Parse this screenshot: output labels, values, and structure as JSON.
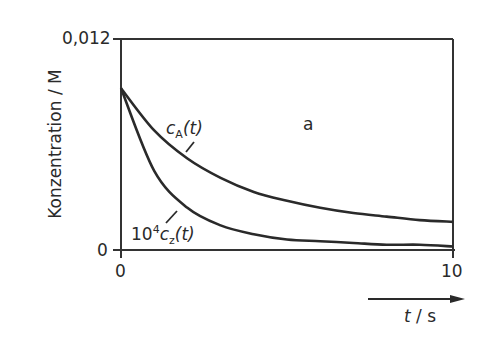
{
  "chart_data": {
    "type": "line",
    "title": "",
    "panel_label": "a",
    "xlabel": "t / s",
    "ylabel": "Konzentration / M",
    "xlim": [
      0,
      10
    ],
    "ylim": [
      0,
      0.012
    ],
    "x_ticks": [
      "0",
      "10"
    ],
    "y_ticks": [
      "0",
      "0,012"
    ],
    "grid": false,
    "legend": "inline annotations",
    "x": [
      0,
      1,
      2,
      3,
      4,
      5,
      6,
      7,
      8,
      9,
      10
    ],
    "series": [
      {
        "name": "c_A(t)",
        "label": "cA(t)",
        "values": [
          0.0092,
          0.0068,
          0.0052,
          0.0041,
          0.0033,
          0.0028,
          0.0024,
          0.0021,
          0.0019,
          0.0017,
          0.0016
        ]
      },
      {
        "name": "10^4 c_Z(t)",
        "label": "10⁴cz(t)",
        "values": [
          0.0092,
          0.0045,
          0.0024,
          0.0014,
          0.0009,
          0.0006,
          0.0005,
          0.0004,
          0.0003,
          0.0003,
          0.0002
        ]
      }
    ]
  },
  "labels": {
    "y_top": "0,012",
    "y_bottom": "0",
    "x_left": "0",
    "x_right": "10",
    "ylabel": "Konzentration / M",
    "xlabel_t": "t",
    "xlabel_unit": " / s",
    "panel": "a",
    "ca_c": "c",
    "ca_sub": "A",
    "ca_arg": "(t)",
    "cz_pre": "10",
    "cz_sup": "4",
    "cz_c": "c",
    "cz_sub": "z",
    "cz_arg": "(t)"
  }
}
